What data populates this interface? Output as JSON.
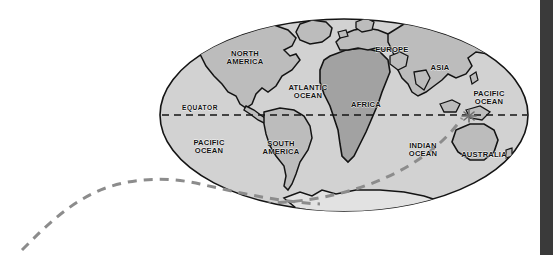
{
  "figure": {
    "kind": "world-map-diagram",
    "projection_shape": "ellipse",
    "background_color": "#ffffff"
  },
  "colors": {
    "ocean_fill": "#d2d2d2",
    "land_fill": "#bcbcbc",
    "africa_fill": "#a2a2a2",
    "antarctica_fill": "#e2e2e2",
    "outline": "#141414",
    "equator_line": "#141414",
    "route_dash": "#8c8c8c",
    "marker": "#6e6e6e",
    "edge_band": "#3a3a3a"
  },
  "labels": {
    "north_america": "NORTH\nAMERICA",
    "south_america": "SOUTH\nAMERICA",
    "europe": "EUROPE",
    "asia": "ASIA",
    "africa": "AFRICA",
    "australia": "AUSTRALIA",
    "atlantic_ocean": "ATLANTIC\nOCEAN",
    "pacific_ocean_left": "PACIFIC\nOCEAN",
    "pacific_ocean_right": "PACIFIC\nOCEAN",
    "indian_ocean": "INDIAN\nOCEAN",
    "equator": "EQUATOR"
  },
  "annotations": {
    "route": {
      "name": "dashed-route-curve",
      "style": "dashed",
      "color": "#8c8c8c",
      "description": "grey dashed S-curve entering from lower-left, crossing Antarctica and rising to the star marker near Indonesia"
    },
    "marker": {
      "name": "star-marker",
      "glyph": "asterisk",
      "color": "#6e6e6e",
      "near": "Indonesia / north of Australia"
    },
    "equator_line": {
      "name": "equator-dashed-line",
      "style": "dashed",
      "color": "#141414"
    }
  }
}
